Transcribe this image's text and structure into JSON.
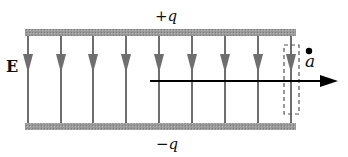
{
  "diagram": {
    "top_plate": {
      "label": "+q",
      "color": "#8c8c8c"
    },
    "bottom_plate": {
      "label": "−q",
      "color": "#8c8c8c"
    },
    "field": {
      "label": "E",
      "line_color": "#6e6e6e",
      "line_count": 9,
      "direction": "down"
    },
    "point": {
      "label": "a"
    },
    "path_arrow": {
      "direction": "right",
      "color": "#000000"
    },
    "gaussian_box": {
      "style": "dashed"
    }
  },
  "colors": {
    "plate": "#8c8c8c",
    "field_line": "#6e6e6e",
    "arrow": "#000000",
    "text": "#111111"
  }
}
